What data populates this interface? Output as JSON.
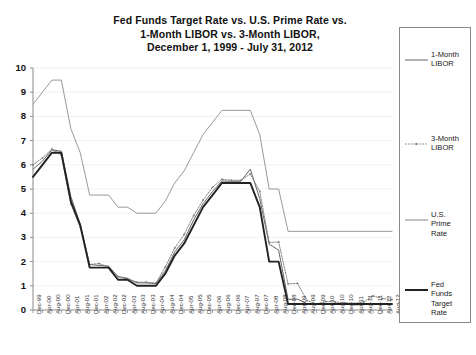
{
  "title": {
    "line1": "Fed Funds Target Rate vs. U.S. Prime Rate vs.",
    "line2": "1-Month LIBOR vs. 3-Month LIBOR,",
    "line3": "December 1, 1999 - July 31, 2012"
  },
  "watermark": "Copyright © 2012 www.FedPrimeRate.com",
  "legend": {
    "items": [
      {
        "label_line1": "1-Month",
        "label_line2": "LIBOR",
        "label_line3": "",
        "label_line4": "",
        "style": "thin-solid",
        "color": "#555555"
      },
      {
        "label_line1": "3-Month",
        "label_line2": "LIBOR",
        "label_line3": "",
        "label_line4": "",
        "style": "dotted-marker",
        "color": "#777777"
      },
      {
        "label_line1": "U.S.",
        "label_line2": "Prime",
        "label_line3": "Rate",
        "label_line4": "",
        "style": "medium-solid",
        "color": "#999999"
      },
      {
        "label_line1": "Fed",
        "label_line2": "Funds",
        "label_line3": "Target",
        "label_line4": "Rate",
        "style": "thick-solid",
        "color": "#222222"
      }
    ]
  },
  "chart_data": {
    "type": "line",
    "title": "Fed Funds Target Rate vs. U.S. Prime Rate vs. 1-Month LIBOR vs. 3-Month LIBOR, December 1, 1999 - July 31, 2012",
    "xlabel": "",
    "ylabel": "",
    "ylim": [
      0,
      10
    ],
    "yticks": [
      0,
      1,
      2,
      3,
      4,
      5,
      6,
      7,
      8,
      9,
      10
    ],
    "grid": true,
    "legend_position": "right",
    "categories": [
      "Dec-99",
      "Apr-00",
      "Aug-00",
      "Dec-00",
      "Apr-01",
      "Aug-01",
      "Dec-01",
      "Apr-02",
      "Aug-02",
      "Dec-02",
      "Apr-03",
      "Aug-03",
      "Dec-03",
      "Apr-04",
      "Aug-04",
      "Dec-04",
      "Apr-05",
      "Aug-05",
      "Dec-05",
      "Apr-06",
      "Aug-06",
      "Dec-06",
      "Apr-07",
      "Aug-07",
      "Dec-07",
      "Apr-08",
      "Aug-08",
      "Dec-08",
      "Apr-09",
      "Aug-09",
      "Dec-09",
      "Apr-10",
      "Aug-10",
      "Dec-10",
      "Apr-11",
      "Aug-11",
      "Dec-11",
      "Apr-12",
      "Aug-12"
    ],
    "series": [
      {
        "name": "U.S. Prime Rate",
        "color": "#999999",
        "values": [
          8.5,
          9.0,
          9.5,
          9.5,
          7.5,
          6.5,
          4.75,
          4.75,
          4.75,
          4.25,
          4.25,
          4.0,
          4.0,
          4.0,
          4.5,
          5.25,
          5.75,
          6.5,
          7.25,
          7.75,
          8.25,
          8.25,
          8.25,
          8.25,
          7.25,
          5.0,
          5.0,
          3.25,
          3.25,
          3.25,
          3.25,
          3.25,
          3.25,
          3.25,
          3.25,
          3.25,
          3.25,
          3.25,
          3.25
        ]
      },
      {
        "name": "Fed Funds Target Rate",
        "color": "#222222",
        "values": [
          5.5,
          6.0,
          6.5,
          6.5,
          4.5,
          3.5,
          1.75,
          1.75,
          1.75,
          1.25,
          1.25,
          1.0,
          1.0,
          1.0,
          1.5,
          2.25,
          2.75,
          3.5,
          4.25,
          4.75,
          5.25,
          5.25,
          5.25,
          5.25,
          4.25,
          2.0,
          2.0,
          0.25,
          0.25,
          0.25,
          0.25,
          0.25,
          0.25,
          0.25,
          0.25,
          0.25,
          0.25,
          0.25,
          0.25
        ]
      },
      {
        "name": "1-Month LIBOR",
        "color": "#555555",
        "values": [
          5.82,
          6.15,
          6.62,
          6.56,
          4.7,
          3.55,
          1.88,
          1.84,
          1.81,
          1.38,
          1.31,
          1.12,
          1.12,
          1.09,
          1.62,
          2.4,
          2.9,
          3.72,
          4.39,
          4.9,
          5.33,
          5.32,
          5.32,
          5.82,
          4.6,
          2.72,
          2.47,
          0.44,
          0.45,
          0.26,
          0.23,
          0.27,
          0.26,
          0.26,
          0.21,
          0.22,
          0.27,
          0.24,
          0.24
        ]
      },
      {
        "name": "3-Month LIBOR",
        "color": "#777777",
        "values": [
          6.0,
          6.28,
          6.65,
          6.4,
          4.38,
          3.43,
          1.88,
          1.92,
          1.78,
          1.38,
          1.28,
          1.15,
          1.15,
          1.11,
          1.78,
          2.56,
          3.12,
          3.9,
          4.54,
          5.07,
          5.4,
          5.36,
          5.36,
          5.62,
          4.9,
          2.79,
          2.81,
          1.08,
          1.1,
          0.39,
          0.25,
          0.35,
          0.33,
          0.3,
          0.27,
          0.33,
          0.58,
          0.47,
          0.43
        ]
      }
    ]
  }
}
